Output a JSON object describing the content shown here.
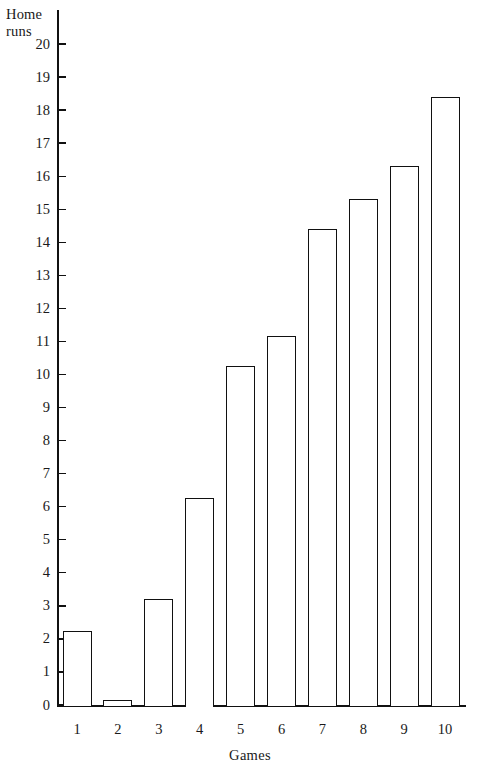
{
  "chart_data": {
    "type": "bar",
    "title": "",
    "subtitle": "",
    "xlabel": "Games",
    "ylabel": "Home\nruns",
    "ylabel_lines": [
      "Home",
      "runs"
    ],
    "categories": [
      "1",
      "2",
      "3",
      "4",
      "5",
      "6",
      "7",
      "8",
      "9",
      "10"
    ],
    "values": [
      2.25,
      0.15,
      3.2,
      6.25,
      10.25,
      11.15,
      14.4,
      15.3,
      16.3,
      18.4
    ],
    "xlim": [
      0.5,
      10.5
    ],
    "ylim": [
      0,
      20.8
    ],
    "ytick_labels": [
      "0",
      "1",
      "2",
      "3",
      "4",
      "5",
      "6",
      "7",
      "8",
      "9",
      "10",
      "11",
      "12",
      "13",
      "14",
      "15",
      "16",
      "17",
      "18",
      "19",
      "20"
    ],
    "ytick_values": [
      0,
      1,
      2,
      3,
      4,
      5,
      6,
      7,
      8,
      9,
      10,
      11,
      12,
      13,
      14,
      15,
      16,
      17,
      18,
      19,
      20
    ],
    "grid": false,
    "legend": false,
    "legend_position": "none",
    "bar_fill_color": "#ffffff",
    "bar_edge_color": "#111111",
    "axis_color": "#111111",
    "background_color": "#ffffff"
  }
}
